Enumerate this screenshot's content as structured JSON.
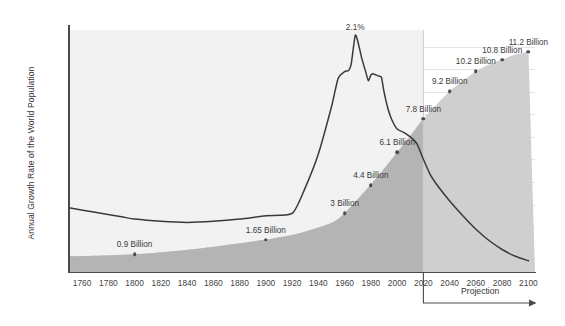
{
  "chart_data": {
    "type": "line",
    "title": "",
    "xlabel": "",
    "ylabel": "Annual Growth Rate of the World Population",
    "xlim": [
      1750,
      2105
    ],
    "ylim": [
      0,
      2.15
    ],
    "grid": true,
    "legend": false,
    "y_unit": "%",
    "y_ticks": [
      "0%",
      "0.2%",
      "0.4%",
      "0.6%",
      "0.8%",
      "1%",
      "1.2%",
      "1.4%",
      "1.6%",
      "1.8%",
      "2%"
    ],
    "y_tick_values": [
      0,
      0.2,
      0.4,
      0.6,
      0.8,
      1.0,
      1.2,
      1.4,
      1.6,
      1.8,
      2.0
    ],
    "x_ticks": [
      "1760",
      "1780",
      "1800",
      "1820",
      "1840",
      "1860",
      "1880",
      "1900",
      "1920",
      "1940",
      "1960",
      "1980",
      "2000",
      "2020",
      "2040",
      "2060",
      "2080",
      "2100"
    ],
    "x_tick_values": [
      1760,
      1780,
      1800,
      1820,
      1840,
      1860,
      1880,
      1900,
      1920,
      1940,
      1960,
      1980,
      2000,
      2020,
      2040,
      2060,
      2080,
      2100
    ],
    "projection_start_year": 2020,
    "projection_label": "Projection",
    "series": [
      {
        "name": "Annual growth rate of the world population",
        "type": "line",
        "color": "#3a3a3a",
        "x": [
          1750,
          1770,
          1790,
          1800,
          1820,
          1840,
          1860,
          1880,
          1900,
          1920,
          1930,
          1940,
          1950,
          1955,
          1960,
          1963,
          1965,
          1968,
          1970,
          1973,
          1976,
          1978,
          1980,
          1982,
          1986,
          1988,
          1990,
          1993,
          1996,
          2000,
          2005,
          2010,
          2015,
          2020,
          2025,
          2030,
          2040,
          2050,
          2060,
          2070,
          2080,
          2090,
          2100
        ],
        "y": [
          0.57,
          0.53,
          0.49,
          0.47,
          0.45,
          0.44,
          0.45,
          0.47,
          0.5,
          0.52,
          0.75,
          1.05,
          1.47,
          1.72,
          1.78,
          1.79,
          1.85,
          2.1,
          2.05,
          1.9,
          1.78,
          1.7,
          1.75,
          1.76,
          1.74,
          1.73,
          1.6,
          1.45,
          1.35,
          1.27,
          1.24,
          1.2,
          1.14,
          1.0,
          0.87,
          0.78,
          0.63,
          0.5,
          0.38,
          0.28,
          0.2,
          0.14,
          0.1
        ]
      },
      {
        "name": "World population (area)",
        "type": "area",
        "color": "#b9b9b9",
        "x": [
          1750,
          1800,
          1850,
          1900,
          1927,
          1950,
          1960,
          1974,
          1987,
          1999,
          2011,
          2020,
          2030,
          2040,
          2050,
          2060,
          2070,
          2080,
          2090,
          2100
        ],
        "y_billions": [
          0.79,
          0.9,
          1.2,
          1.65,
          2.0,
          2.5,
          3.0,
          4.0,
          5.0,
          6.0,
          7.0,
          7.8,
          8.5,
          9.2,
          9.7,
          10.2,
          10.55,
          10.8,
          11.05,
          11.2
        ]
      }
    ],
    "annotations": [
      {
        "name": "peak-growth",
        "text": "2.1%",
        "x": 1968,
        "y_percent": 2.1
      }
    ],
    "population_markers": [
      {
        "label": "0.9 Billion",
        "year": 1800,
        "billions": 0.9
      },
      {
        "label": "1.65 Billion",
        "year": 1900,
        "billions": 1.65
      },
      {
        "label": "3 Billion",
        "year": 1960,
        "billions": 3
      },
      {
        "label": "4.4 Billion",
        "year": 1980,
        "billions": 4.4
      },
      {
        "label": "6.1 Billion",
        "year": 2000,
        "billions": 6.1
      },
      {
        "label": "7.8 Billion",
        "year": 2020,
        "billions": 7.8
      },
      {
        "label": "9.2 Billion",
        "year": 2040,
        "billions": 9.2
      },
      {
        "label": "10.2 Billion",
        "year": 2060,
        "billions": 10.2
      },
      {
        "label": "10.8 Billion",
        "year": 2080,
        "billions": 10.8
      },
      {
        "label": "11.2 Billion",
        "year": 2100,
        "billions": 11.2
      }
    ],
    "colors": {
      "line": "#3a3a3a",
      "area_historical": "#b4b4b4",
      "area_projection": "#cfcfcf",
      "grid": "#e4e4e4",
      "axis": "#4a4a4a",
      "text": "#3d3d3d",
      "background": "#ffffff"
    }
  }
}
